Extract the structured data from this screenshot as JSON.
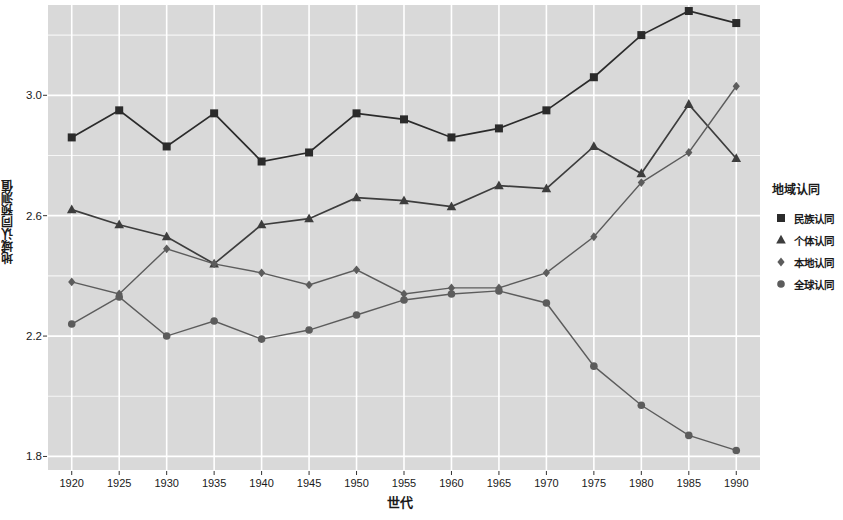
{
  "chart_data": {
    "type": "line",
    "title": "",
    "xlabel": "世代",
    "ylabel": "地域认同预测值",
    "x": [
      1920,
      1925,
      1930,
      1935,
      1940,
      1945,
      1950,
      1955,
      1960,
      1965,
      1970,
      1975,
      1980,
      1985,
      1990
    ],
    "xticks": [
      "1920",
      "1925",
      "1930",
      "1935",
      "1940",
      "1945",
      "1950",
      "1955",
      "1960",
      "1965",
      "1970",
      "1975",
      "1980",
      "1985",
      "1990"
    ],
    "yticks": [
      "1.8",
      "2.2",
      "2.6",
      "3.0"
    ],
    "ytick_values": [
      1.8,
      2.2,
      2.6,
      3.0
    ],
    "xlim": [
      1917.5,
      1992.5
    ],
    "ylim": [
      1.755,
      3.3
    ],
    "grid": true,
    "panel_color": "#d9d9d9",
    "grid_color": "#ffffff",
    "legend": {
      "title": "地域认同",
      "position": "right"
    },
    "series": [
      {
        "name": "民族认同",
        "marker": "square",
        "color": "#2b2b2b",
        "values": [
          2.86,
          2.95,
          2.83,
          2.94,
          2.78,
          2.81,
          2.94,
          2.92,
          2.86,
          2.89,
          2.95,
          3.06,
          3.2,
          3.28,
          3.24
        ]
      },
      {
        "name": "个体认同",
        "marker": "triangle",
        "color": "#3d3d3d",
        "values": [
          2.62,
          2.57,
          2.53,
          2.44,
          2.57,
          2.59,
          2.66,
          2.65,
          2.63,
          2.7,
          2.69,
          2.83,
          2.74,
          2.97,
          2.79
        ]
      },
      {
        "name": "本地认同",
        "marker": "diamond",
        "color": "#5c5c5c",
        "values": [
          2.38,
          2.34,
          2.49,
          2.44,
          2.41,
          2.37,
          2.42,
          2.34,
          2.36,
          2.36,
          2.41,
          2.53,
          2.71,
          2.81,
          3.03
        ]
      },
      {
        "name": "全球认同",
        "marker": "circle",
        "color": "#5c5c5c",
        "values": [
          2.24,
          2.33,
          2.2,
          2.25,
          2.19,
          2.22,
          2.27,
          2.32,
          2.34,
          2.35,
          2.31,
          2.1,
          1.97,
          1.87,
          1.82
        ]
      }
    ]
  }
}
